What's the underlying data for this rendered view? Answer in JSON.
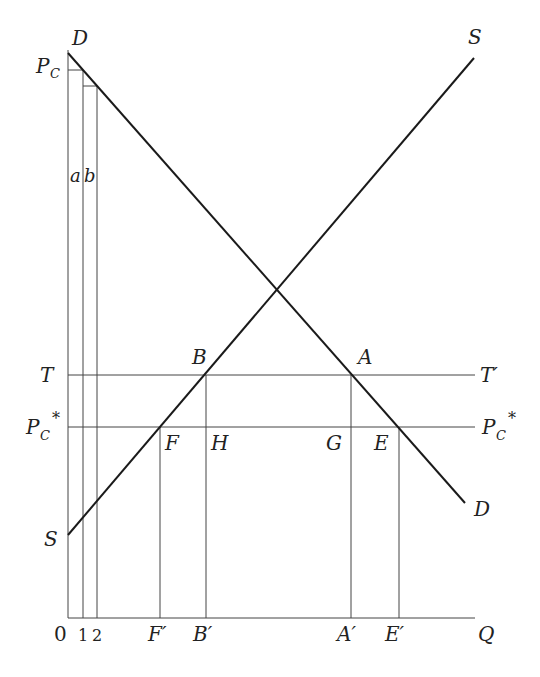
{
  "diagram": {
    "curves": {
      "demand": {
        "name": "D",
        "start_label": "D",
        "end_label": "D"
      },
      "supply": {
        "name": "S",
        "start_label": "S",
        "end_label": "S"
      }
    },
    "axis_labels": {
      "origin": "0",
      "x_axis": "Q",
      "x_ticks": [
        "1",
        "2"
      ],
      "x_points": [
        "F′",
        "B′",
        "A′",
        "E′"
      ]
    },
    "price_levels": {
      "pc": {
        "base": "P",
        "sub": "C"
      },
      "tariff": {
        "left": "T",
        "right": "T′"
      },
      "pc_star": {
        "base": "P",
        "sub": "C",
        "sup": "*"
      }
    },
    "points": {
      "B": "B",
      "A": "A",
      "F": "F",
      "H": "H",
      "G": "G",
      "E": "E"
    },
    "strip_labels": {
      "a": "a",
      "b": "b"
    }
  }
}
